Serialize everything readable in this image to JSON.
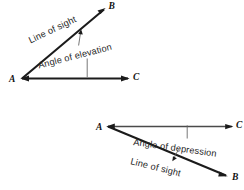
{
  "figure": {
    "background_color": "#ffffff",
    "line_color": "#1b1b1b",
    "label_color": "#111111",
    "annotation_color": "#262626",
    "leader_color": "#5e5e5e",
    "width": 244,
    "height": 190
  },
  "elevation_diagram": {
    "name": "angle-of-elevation",
    "vertex_labels": {
      "a": "A",
      "b": "B",
      "c": "C"
    },
    "annotations": {
      "line_of_sight": "Line of sight",
      "angle": "Angle of elevation"
    }
  },
  "depression_diagram": {
    "name": "angle-of-depression",
    "vertex_labels": {
      "a": "A",
      "b": "B",
      "c": "C"
    },
    "annotations": {
      "angle": "Angle of depression",
      "line_of_sight": "Line of sight"
    }
  }
}
